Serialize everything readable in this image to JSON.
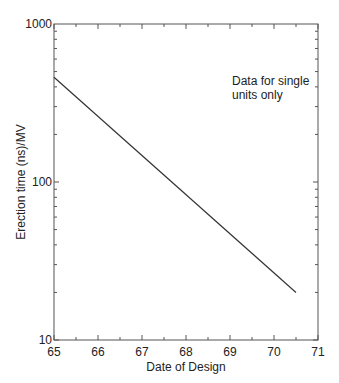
{
  "chart_data": {
    "type": "line",
    "title": "",
    "xlabel": "Date of Design",
    "ylabel": "Erection time (ns)/MV",
    "xlim": [
      65,
      71
    ],
    "ylim": [
      10,
      1000
    ],
    "yscale": "log",
    "xticks": [
      "65",
      "66",
      "67",
      "68",
      "69",
      "70",
      "71"
    ],
    "yticks": [
      "10",
      "100",
      "1000"
    ],
    "grid": false,
    "legend": null,
    "annotations": [
      {
        "text": "Data for single units only",
        "lines": [
          "Data for single",
          "units only"
        ],
        "x": 68.7,
        "y": 350
      }
    ],
    "series": [
      {
        "name": "Erection time",
        "x": [
          65,
          70.5
        ],
        "y": [
          460,
          20
        ]
      }
    ]
  },
  "labels": {
    "xlabel": "Date of Design",
    "ylabel": "Erection time (ns)/MV",
    "annotation_line1": "Data for single",
    "annotation_line2": "units only",
    "xtick_65": "65",
    "xtick_66": "66",
    "xtick_67": "67",
    "xtick_68": "68",
    "xtick_69": "69",
    "xtick_70": "70",
    "xtick_71": "71",
    "ytick_10": "10",
    "ytick_100": "100",
    "ytick_1000": "1000"
  },
  "colors": {
    "axis": "#555555",
    "line": "#333333",
    "text": "#222222"
  }
}
